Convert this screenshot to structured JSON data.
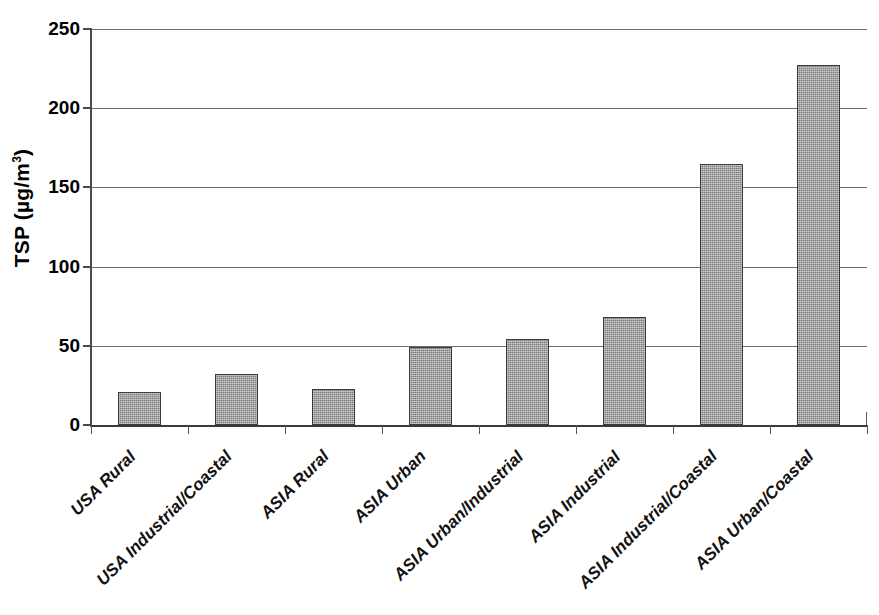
{
  "chart_data": {
    "type": "bar",
    "title": "",
    "xlabel": "",
    "ylabel": "TSP (µg/m",
    "ylabel_sup": "3",
    "ylabel_suffix": ")",
    "ylim": [
      0,
      250
    ],
    "ytick_values": [
      0,
      50,
      100,
      150,
      200,
      250
    ],
    "ytick_labels": [
      "0",
      "50",
      "100",
      "150",
      "200",
      "250"
    ],
    "grid": true,
    "legend": "none",
    "bar_color": "#9b9b9b",
    "bar_edge_color": "#3c3c3c",
    "categories": [
      "USA Rural",
      "USA Industrial/Coastal",
      "ASIA Rural",
      "ASIA Urban",
      "ASIA Urban/Industrial",
      "ASIA Industrial",
      "ASIA Industrial/Coastal",
      "ASIA Urban/Coastal"
    ],
    "values": [
      21,
      32,
      23,
      49,
      54,
      68,
      165,
      227
    ]
  }
}
